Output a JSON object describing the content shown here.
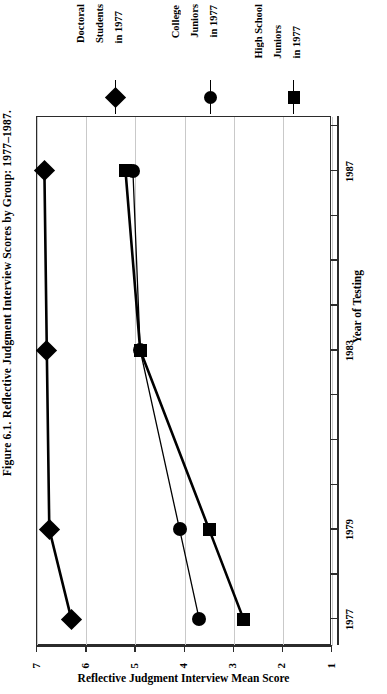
{
  "figure": {
    "caption": "Figure 6.1. Reflective Judgment Interview Scores by Group: 1977–1987."
  },
  "legend": {
    "position": "top",
    "entries": [
      {
        "name": "doctoral-students",
        "line1": "Doctoral",
        "line2": "Students",
        "line3": "in 1977",
        "marker": "diamond",
        "full": "Doctoral Students in 1977"
      },
      {
        "name": "college-juniors",
        "line1": "College",
        "line2": "Juniors",
        "line3": "in 1977",
        "marker": "circle",
        "full": "College Juniors in 1977"
      },
      {
        "name": "high-school-juniors",
        "line1": "High School",
        "line2": "Juniors",
        "line3": "in 1977",
        "marker": "square",
        "full": "High School Juniors in 1977"
      }
    ]
  },
  "value_axis": {
    "title": "Reflective Judgment Interview Mean Score",
    "ticks": [
      "7",
      "6",
      "5",
      "4",
      "3",
      "2",
      "1"
    ]
  },
  "year_axis": {
    "title": "Year of Testing",
    "labels": [
      "1987",
      "1983",
      "1979",
      "1977"
    ]
  },
  "chart_data": {
    "type": "line",
    "title": "Figure 6.1. Reflective Judgment Interview Scores by Group: 1977–1987.",
    "orientation": "rotated-90",
    "xlabel": "Reflective Judgment Interview Mean Score",
    "ylabel": "Year of Testing",
    "xlim": [
      7,
      1
    ],
    "ylim": [
      1977,
      1988
    ],
    "grid": true,
    "x_ticks": [
      7,
      6,
      5,
      4,
      3,
      2,
      1
    ],
    "y_ticks": [
      1977,
      1979,
      1983,
      1987
    ],
    "legend_position": "top",
    "categories": [
      1977,
      1979,
      1983,
      1987
    ],
    "series": [
      {
        "name": "Doctoral Students in 1977",
        "marker": "diamond",
        "color": "#000000",
        "x": [
          1977,
          1979,
          1983,
          1987
        ],
        "values": [
          6.3,
          6.75,
          6.8,
          6.85
        ]
      },
      {
        "name": "College Juniors in 1977",
        "marker": "circle",
        "color": "#000000",
        "x": [
          1977,
          1979,
          1983,
          1987
        ],
        "values": [
          3.7,
          4.1,
          4.9,
          5.05
        ]
      },
      {
        "name": "High School Juniors in 1977",
        "marker": "square",
        "color": "#000000",
        "x": [
          1977,
          1979,
          1983,
          1987
        ],
        "values": [
          2.8,
          3.5,
          4.9,
          5.2
        ]
      }
    ]
  }
}
